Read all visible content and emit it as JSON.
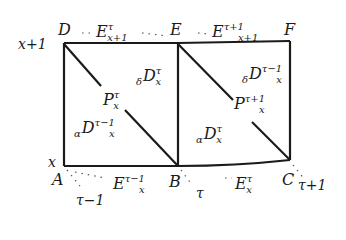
{
  "diagram": {
    "type": "Lexis diagram",
    "vertices": {
      "A": "A",
      "B": "B",
      "C": "C",
      "D": "D",
      "E": "E",
      "F": "F"
    },
    "age_labels": {
      "top": "x+1",
      "bottom": "x"
    },
    "time_labels": {
      "left": "τ−1",
      "middle": "τ",
      "right": "τ+1"
    },
    "top_edge": [
      {
        "base": "E",
        "sup": "τ",
        "sub": "x+1"
      },
      {
        "base": "E",
        "sup": "τ+1",
        "sub": "x+1"
      }
    ],
    "bottom_edge": [
      {
        "base": "E",
        "sup": "τ−1",
        "sub": "x"
      },
      {
        "base": "E",
        "sup": "τ",
        "sub": "x"
      }
    ],
    "left_square": {
      "upper_death": {
        "pre": "δ",
        "base": "D",
        "sup": "τ",
        "sub": "x"
      },
      "population": {
        "base": "P",
        "sup": "τ",
        "sub": "x"
      },
      "lower_death": {
        "pre": "α",
        "base": "D",
        "sup": "τ−1",
        "sub": "x"
      }
    },
    "right_square": {
      "upper_death": {
        "pre": "δ",
        "base": "D",
        "sup": "τ−1",
        "sub": "x"
      },
      "population": {
        "base": "P",
        "sup": "τ+1",
        "sub": "x"
      },
      "lower_death": {
        "pre": "α",
        "base": "D",
        "sup": "τ",
        "sub": "x"
      }
    }
  }
}
